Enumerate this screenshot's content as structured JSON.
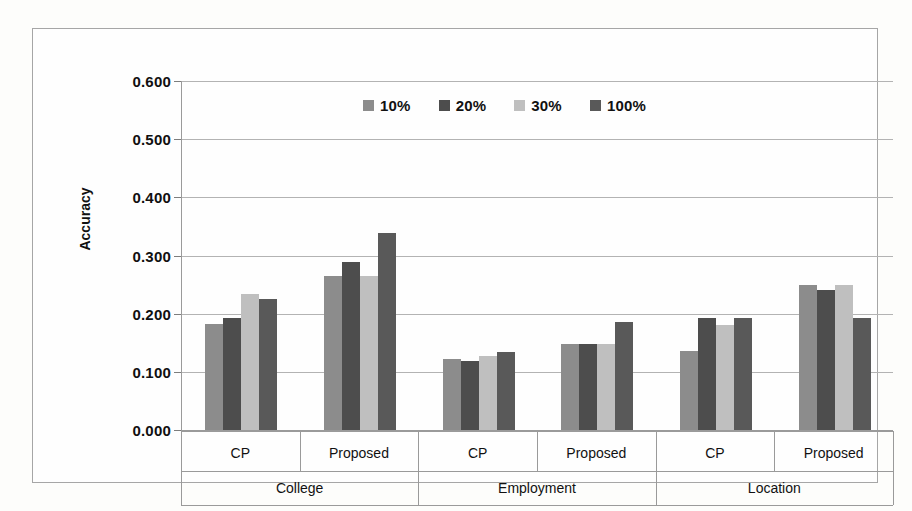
{
  "chart_data": {
    "type": "bar",
    "title": "",
    "subtitle": "",
    "xlabel": "",
    "ylabel": "Accuracy",
    "ylim": [
      0.0,
      0.6
    ],
    "ytick_labels": [
      "0.000",
      "0.100",
      "0.200",
      "0.300",
      "0.400",
      "0.500",
      "0.600"
    ],
    "ytick_values": [
      0.0,
      0.1,
      0.2,
      0.3,
      0.4,
      0.5,
      0.6
    ],
    "grid": true,
    "legend_position": "top-center",
    "legend": [
      "10%",
      "20%",
      "30%",
      "100%"
    ],
    "group_labels": [
      "College",
      "Employment",
      "Location"
    ],
    "categories": [
      "College / CP",
      "College / Proposed",
      "Employment / CP",
      "Employment / Proposed",
      "Location / CP",
      "Location / Proposed"
    ],
    "category_inner_labels": [
      "CP",
      "Proposed",
      "CP",
      "Proposed",
      "CP",
      "Proposed"
    ],
    "series": [
      {
        "name": "10%",
        "color": "#8c8c8c",
        "values": [
          0.182,
          0.265,
          0.122,
          0.148,
          0.135,
          0.25
        ]
      },
      {
        "name": "20%",
        "color": "#4d4d4d",
        "values": [
          0.193,
          0.288,
          0.118,
          0.148,
          0.192,
          0.24
        ]
      },
      {
        "name": "30%",
        "color": "#bfbfbf",
        "values": [
          0.234,
          0.265,
          0.128,
          0.148,
          0.181,
          0.25
        ]
      },
      {
        "name": "100%",
        "color": "#595959",
        "values": [
          0.226,
          0.338,
          0.134,
          0.186,
          0.192,
          0.192
        ]
      }
    ]
  },
  "colors": {
    "background": "#fdfdfb",
    "frame_border": "#a6a6a6",
    "gridline": "#b3b3b3",
    "axis_line": "#9a9a9a",
    "text": "#111111"
  }
}
